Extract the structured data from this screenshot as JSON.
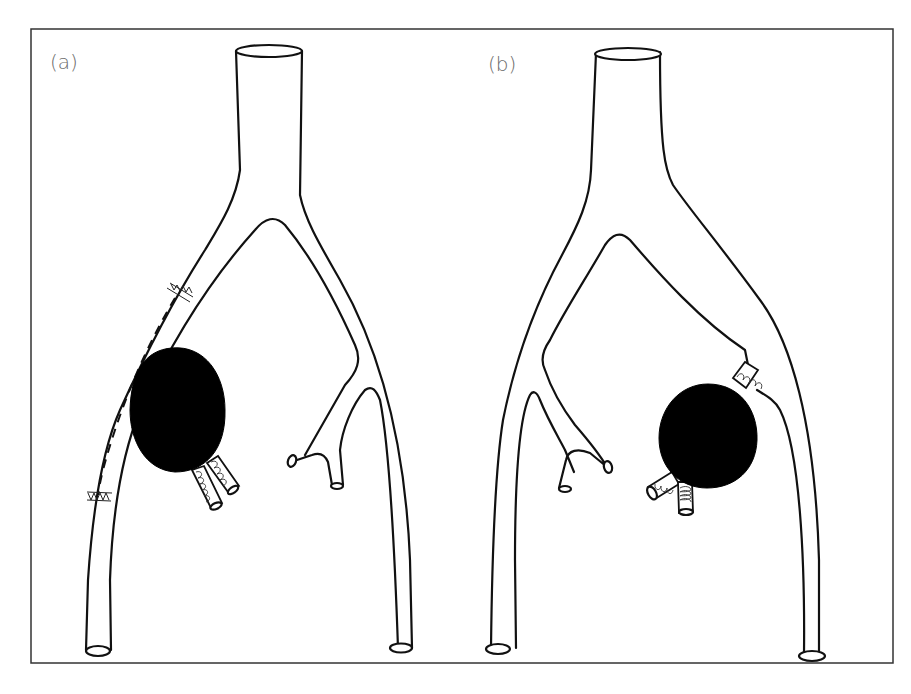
{
  "figure": {
    "panels": [
      {
        "id": "a",
        "label": "(a)",
        "description": "Bypass graft with stented ends along left branch; aneurysm with two coil-filled branches (excluded)"
      },
      {
        "id": "b",
        "label": "(b)",
        "description": "Aneurysm at right-branch bifurcation with three coil-filled stubs"
      }
    ],
    "colors": {
      "outline": "#111111",
      "aneurysm": "#000000",
      "label": "#6b6b6b",
      "frame": "#333333",
      "background": "#ffffff"
    }
  }
}
